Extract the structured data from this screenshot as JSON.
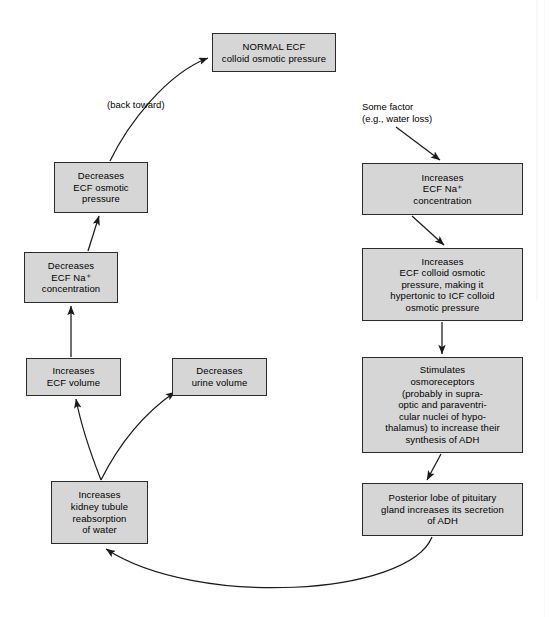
{
  "canvas": {
    "width": 551,
    "height": 617,
    "background": "#ffffff"
  },
  "style": {
    "node_fill": "#d6d6d6",
    "node_border": "#2b2b2b",
    "text_color": "#000000",
    "arrow_color": "#1a1a1a"
  },
  "nodes": {
    "normal_ecf": {
      "text": "NORMAL ECF\ncolloid osmotic pressure",
      "x": 212,
      "y": 33,
      "w": 124,
      "h": 39
    },
    "decreases_ecf_osmotic": {
      "text": "Decreases\nECF osmotic\npressure",
      "x": 54,
      "y": 162,
      "w": 94,
      "h": 51
    },
    "decreases_ecf_na": {
      "text": "Decreases\nECF Na⁺\nconcentration",
      "x": 24,
      "y": 252,
      "w": 94,
      "h": 51
    },
    "increases_ecf_volume": {
      "text": "Increases\nECF volume",
      "x": 26,
      "y": 358,
      "w": 95,
      "h": 38
    },
    "decreases_urine_volume": {
      "text": "Decreases\nurine volume",
      "x": 172,
      "y": 358,
      "w": 95,
      "h": 38
    },
    "increases_kidney_reabsorption": {
      "text": "Increases\nkidney tubule\nreabsorption\nof water",
      "x": 51,
      "y": 481,
      "w": 97,
      "h": 63
    },
    "increases_ecf_na": {
      "text": "Increases\nECF Na⁺\nconcentration",
      "x": 362,
      "y": 163,
      "w": 161,
      "h": 52
    },
    "increases_ecf_colloid": {
      "text": "Increases\nECF colloid osmotic\npressure, making it\nhypertonic to ICF colloid\nosmotic pressure",
      "x": 362,
      "y": 248,
      "w": 161,
      "h": 73
    },
    "stimulates_osmoreceptors": {
      "text": "Stimulates\nosmoreceptors\n(probably in supra-\noptic and paraventri-\ncular nuclei of hypo-\nthalamus) to increase their\nsynthesis of ADH",
      "x": 362,
      "y": 357,
      "w": 161,
      "h": 96
    },
    "posterior_pituitary": {
      "text": "Posterior lobe of pituitary\ngland increases its secretion\nof ADH",
      "x": 362,
      "y": 483,
      "w": 161,
      "h": 53
    }
  },
  "captions": {
    "back_toward": {
      "text": "(back toward)",
      "x": 107,
      "y": 99
    },
    "some_factor": {
      "text": "Some factor\n(e.g., water loss)",
      "x": 362,
      "y": 101
    }
  },
  "edges": [
    {
      "name": "some-factor-to-increases-ecf-na",
      "from": "some_factor",
      "to": "increases_ecf_na"
    },
    {
      "name": "increases-ecf-na-to-colloid",
      "from": "increases_ecf_na",
      "to": "increases_ecf_colloid"
    },
    {
      "name": "colloid-to-osmoreceptors",
      "from": "increases_ecf_colloid",
      "to": "stimulates_osmoreceptors"
    },
    {
      "name": "osmoreceptors-to-pituitary",
      "from": "stimulates_osmoreceptors",
      "to": "posterior_pituitary"
    },
    {
      "name": "pituitary-to-kidney",
      "from": "posterior_pituitary",
      "to": "increases_kidney_reabsorption"
    },
    {
      "name": "kidney-to-urine-volume",
      "from": "increases_kidney_reabsorption",
      "to": "decreases_urine_volume"
    },
    {
      "name": "kidney-to-ecf-volume",
      "from": "increases_kidney_reabsorption",
      "to": "increases_ecf_volume"
    },
    {
      "name": "ecf-volume-to-decreases-na",
      "from": "increases_ecf_volume",
      "to": "decreases_ecf_na"
    },
    {
      "name": "decreases-na-to-decreases-osmotic",
      "from": "decreases_ecf_na",
      "to": "decreases_ecf_osmotic"
    },
    {
      "name": "decreases-osmotic-to-normal-ecf",
      "from": "decreases_ecf_osmotic",
      "to": "normal_ecf"
    }
  ]
}
